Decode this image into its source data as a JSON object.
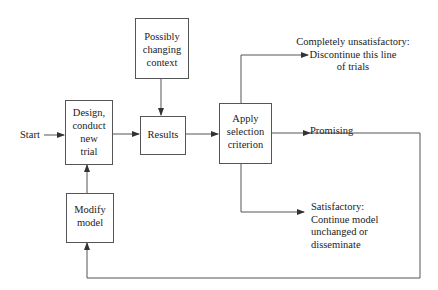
{
  "diagram": {
    "title": "",
    "nodes": {
      "start": {
        "label": "Start"
      },
      "design": {
        "label": "Design,\nconduct\nnew\ntrial"
      },
      "context": {
        "label": "Possibly\nchanging\ncontext"
      },
      "results": {
        "label": "Results"
      },
      "apply": {
        "label": "Apply\nselection\ncriterion"
      },
      "modify": {
        "label": "Modify\nmodel"
      }
    },
    "outcomes": {
      "unsatisfactory": {
        "label": "Completely unsatisfactory:\nDiscontinue this line\nof trials"
      },
      "promising": {
        "label": "Promising"
      },
      "satisfactory": {
        "label": "Satisfactory:\nContinue model\nunchanged or\ndisseminate"
      }
    },
    "edges": [
      {
        "from": "start",
        "to": "design"
      },
      {
        "from": "design",
        "to": "results"
      },
      {
        "from": "context",
        "to": "results"
      },
      {
        "from": "results",
        "to": "apply"
      },
      {
        "from": "apply",
        "to": "unsatisfactory"
      },
      {
        "from": "apply",
        "to": "promising"
      },
      {
        "from": "apply",
        "to": "satisfactory"
      },
      {
        "from": "promising",
        "to": "modify"
      },
      {
        "from": "modify",
        "to": "design"
      }
    ],
    "colors": {
      "line": "#555555",
      "text": "#222222",
      "background": "#ffffff"
    }
  }
}
